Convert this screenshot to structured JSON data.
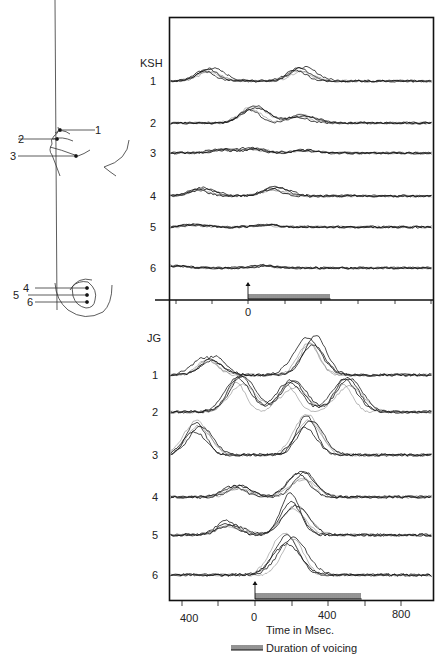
{
  "chart_data": {
    "type": "line",
    "title": "",
    "xlabel": "Time in Msec.",
    "ylabel": "",
    "legend": [
      {
        "symbol": "hatched-bar",
        "label": "Duration of voicing"
      }
    ],
    "panels": [
      {
        "name": "KSH",
        "zero_tick_label": "0",
        "voicing_ms": [
          0,
          450
        ],
        "channels": [
          {
            "label": "1",
            "peaks_ms": [
              [
                -220,
                0.55
              ],
              [
                280,
                0.6
              ]
            ]
          },
          {
            "label": "2",
            "peaks_ms": [
              [
                20,
                0.75
              ],
              [
                280,
                0.35
              ]
            ]
          },
          {
            "label": "3",
            "peaks_ms": [
              [
                -150,
                0.15
              ],
              [
                20,
                0.18
              ],
              [
                300,
                0.12
              ]
            ]
          },
          {
            "label": "4",
            "peaks_ms": [
              [
                -250,
                0.3
              ],
              [
                150,
                0.35
              ]
            ]
          },
          {
            "label": "5",
            "peaks_ms": [
              [
                -300,
                0.1
              ],
              [
                100,
                0.1
              ]
            ]
          },
          {
            "label": "6",
            "peaks_ms": [
              [
                -400,
                0.1
              ],
              [
                80,
                0.12
              ]
            ]
          }
        ]
      },
      {
        "name": "JG",
        "voicing_ms": [
          0,
          580
        ],
        "channels": [
          {
            "label": "1",
            "peaks_ms": [
              [
                -250,
                0.45
              ],
              [
                300,
                0.95
              ]
            ]
          },
          {
            "label": "2",
            "peaks_ms": [
              [
                -80,
                0.8
              ],
              [
                200,
                0.7
              ],
              [
                500,
                0.75
              ]
            ]
          },
          {
            "label": "3",
            "peaks_ms": [
              [
                -300,
                0.75
              ],
              [
                300,
                0.9
              ]
            ]
          },
          {
            "label": "4",
            "peaks_ms": [
              [
                -100,
                0.25
              ],
              [
                250,
                0.55
              ]
            ]
          },
          {
            "label": "5",
            "peaks_ms": [
              [
                -150,
                0.3
              ],
              [
                200,
                0.9
              ]
            ]
          },
          {
            "label": "6",
            "peaks_ms": [
              [
                150,
                0.45
              ],
              [
                200,
                0.55
              ]
            ]
          }
        ]
      }
    ],
    "x_ticks": [
      -400,
      0,
      400,
      800
    ],
    "x_tick_labels": [
      "400",
      "0",
      "400",
      "800"
    ],
    "xlim": [
      -600,
      1000
    ]
  },
  "figure": {
    "ksh_label": "KSH",
    "jg_label": "JG",
    "ksh_channel_labels": [
      "1",
      "2",
      "3",
      "4",
      "5",
      "6"
    ],
    "jg_channel_labels": [
      "1",
      "2",
      "3",
      "4",
      "5",
      "6"
    ],
    "zero_label": "0",
    "bottom_ticks": [
      "400",
      "0",
      "400",
      "800"
    ],
    "xlabel": "Time in Msec.",
    "legend_label": "Duration of voicing",
    "lip_diagram_labels": [
      "1",
      "2",
      "3"
    ],
    "tongue_diagram_labels": [
      "4",
      "5",
      "6"
    ]
  }
}
